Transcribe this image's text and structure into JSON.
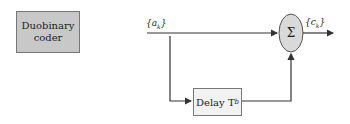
{
  "coder": {
    "line1": "Duobinary",
    "line2": "coder"
  },
  "input_label": "{a",
  "input_sub": "k",
  "input_close": "}",
  "output_label": "{c",
  "output_sub": "k",
  "output_close": "}",
  "sum_symbol": "Σ",
  "delay": {
    "label": "Delay T",
    "sub": "b"
  },
  "colors": {
    "coder_fill": "#c8c8c8",
    "sum_fill": "#d9d9d9",
    "delay_fill": "#f2f2f2",
    "line": "#333333"
  }
}
